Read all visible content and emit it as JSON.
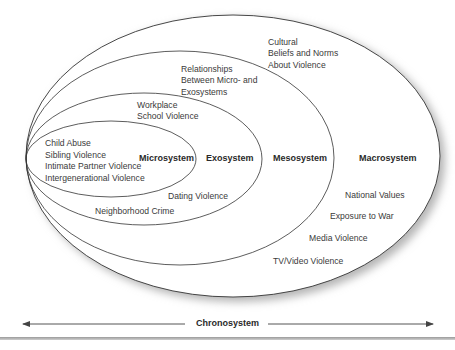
{
  "diagram": {
    "type": "nested-ellipses",
    "systems": [
      {
        "name": "Microsystem",
        "items": [
          "Child Abuse",
          "Sibling Violence",
          "Intimate Partner Violence",
          "Intergenerational Violence"
        ]
      },
      {
        "name": "Exosystem",
        "items": [
          "Workplace",
          "School Violence",
          "Dating Violence",
          "Neighborhood Crime"
        ]
      },
      {
        "name": "Mesosystem",
        "items": [
          "Relationships",
          "Between Micro- and",
          "Exosystems"
        ]
      },
      {
        "name": "Macrosystem",
        "items": [
          "Cultural",
          "Beliefs and Norms",
          "About Violence",
          "National Values",
          "Exposure to War",
          "Media Violence",
          "TV/Video Violence"
        ]
      }
    ],
    "timeline": {
      "label": "Chronosystem",
      "direction": "bidirectional"
    },
    "colors": {
      "stroke": "#333333",
      "shadow": "#b0b0b0",
      "background": "#ffffff"
    }
  }
}
